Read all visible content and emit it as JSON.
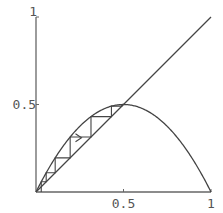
{
  "chart_data": {
    "type": "line",
    "title": "",
    "subtitle": "Cobweb diagram of logistic map f(x) = 2x(1 - x)",
    "xlabel": "",
    "ylabel": "",
    "xlim": [
      0,
      1
    ],
    "ylim": [
      0,
      1
    ],
    "grid": false,
    "legend": null,
    "x_ticks": [
      {
        "value": 0.5,
        "label": "0.5"
      },
      {
        "value": 1,
        "label": "1"
      }
    ],
    "y_ticks": [
      {
        "value": 0.5,
        "label": "0.5"
      },
      {
        "value": 1,
        "label": "1"
      }
    ],
    "series": [
      {
        "name": "f(x) = 2x(1-x)",
        "kind": "curve",
        "r": 2,
        "x": [
          0,
          0.1,
          0.2,
          0.3,
          0.4,
          0.5,
          0.6,
          0.7,
          0.8,
          0.9,
          1.0
        ],
        "y": [
          0,
          0.18,
          0.32,
          0.42,
          0.48,
          0.5,
          0.48,
          0.42,
          0.32,
          0.18,
          0
        ]
      },
      {
        "name": "y = x",
        "kind": "diagonal",
        "x": [
          0,
          1
        ],
        "y": [
          0,
          1
        ]
      },
      {
        "name": "cobweb",
        "kind": "cobweb",
        "x0": 0.03,
        "iterations": 8
      }
    ],
    "annotations": [
      {
        "type": "arrow",
        "direction": "right",
        "x": 0.26,
        "y": 0.31
      }
    ],
    "colors": {
      "line": "#444444",
      "axis": "#666666",
      "text": "#555555"
    }
  }
}
